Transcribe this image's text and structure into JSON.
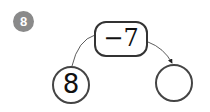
{
  "problem": {
    "number": "8"
  },
  "diagram": {
    "operation": "−7",
    "start_value": "8",
    "result_value": ""
  }
}
